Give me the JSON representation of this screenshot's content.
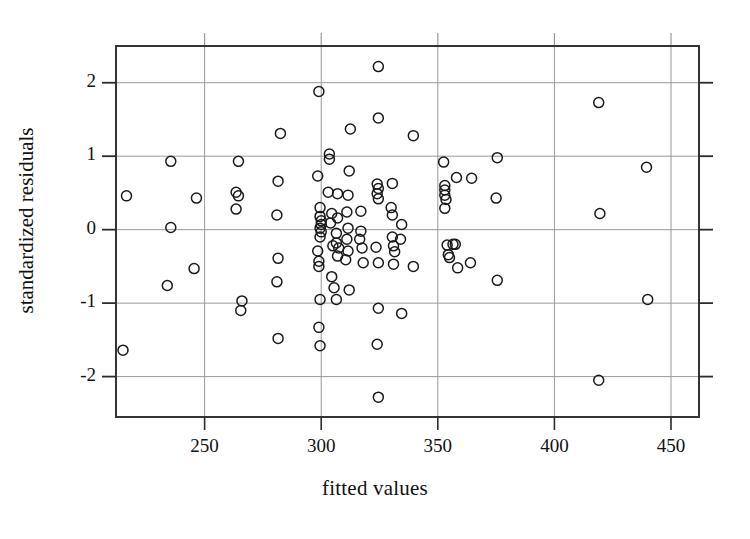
{
  "chart_data": {
    "type": "scatter",
    "title": "",
    "xlabel": "fitted values",
    "ylabel": "standardized residuals",
    "xlim": [
      212,
      462
    ],
    "ylim": [
      -2.55,
      2.5
    ],
    "xticks": [
      250,
      300,
      350,
      400,
      450
    ],
    "yticks": [
      2,
      1,
      0,
      -1,
      -2
    ],
    "xtick_labels": [
      "250",
      "300",
      "350",
      "400",
      "450"
    ],
    "ytick_labels": [
      "2",
      "1",
      "0",
      "-1",
      "-2"
    ],
    "grid": true,
    "grid_color": "#9a9a9a",
    "frame_color": "#2b2b2b",
    "marker": "open-circle",
    "marker_color": "#1a1a1a",
    "marker_radius": 5,
    "legend": null,
    "n_points": 108,
    "points": [
      [
        216.5,
        0.46
      ],
      [
        215.0,
        -1.64
      ],
      [
        235.5,
        0.93
      ],
      [
        235.5,
        0.03
      ],
      [
        234.0,
        -0.76
      ],
      [
        246.5,
        0.43
      ],
      [
        245.5,
        -0.53
      ],
      [
        264.5,
        0.93
      ],
      [
        263.5,
        0.51
      ],
      [
        264.5,
        0.46
      ],
      [
        263.5,
        0.28
      ],
      [
        266.0,
        -0.97
      ],
      [
        265.5,
        -1.1
      ],
      [
        282.5,
        1.31
      ],
      [
        281.5,
        0.66
      ],
      [
        281.0,
        0.2
      ],
      [
        281.5,
        -0.39
      ],
      [
        281.0,
        -0.71
      ],
      [
        281.5,
        -1.48
      ],
      [
        299.0,
        1.88
      ],
      [
        298.5,
        0.73
      ],
      [
        299.5,
        0.3
      ],
      [
        299.5,
        0.18
      ],
      [
        300.0,
        0.12
      ],
      [
        300.0,
        0.07
      ],
      [
        299.5,
        0.02
      ],
      [
        300.0,
        -0.03
      ],
      [
        299.5,
        -0.1
      ],
      [
        298.5,
        -0.29
      ],
      [
        299.0,
        -0.43
      ],
      [
        299.0,
        -0.5
      ],
      [
        299.5,
        -0.95
      ],
      [
        299.0,
        -1.33
      ],
      [
        299.5,
        -1.58
      ],
      [
        303.5,
        1.03
      ],
      [
        303.5,
        0.96
      ],
      [
        303.0,
        0.51
      ],
      [
        304.5,
        0.22
      ],
      [
        304.0,
        0.09
      ],
      [
        305.0,
        -0.22
      ],
      [
        304.5,
        -0.64
      ],
      [
        305.5,
        -0.79
      ],
      [
        307.0,
        0.49
      ],
      [
        307.0,
        0.16
      ],
      [
        306.5,
        -0.05
      ],
      [
        306.5,
        -0.18
      ],
      [
        307.5,
        -0.25
      ],
      [
        307.0,
        -0.36
      ],
      [
        306.5,
        -0.95
      ],
      [
        312.5,
        1.37
      ],
      [
        312.0,
        0.8
      ],
      [
        311.5,
        0.47
      ],
      [
        311.0,
        0.24
      ],
      [
        311.5,
        0.02
      ],
      [
        311.0,
        -0.13
      ],
      [
        311.5,
        -0.29
      ],
      [
        310.5,
        -0.41
      ],
      [
        312.0,
        -0.82
      ],
      [
        317.0,
        0.25
      ],
      [
        317.0,
        -0.02
      ],
      [
        316.5,
        -0.13
      ],
      [
        317.5,
        -0.25
      ],
      [
        318.0,
        -0.45
      ],
      [
        324.5,
        2.22
      ],
      [
        324.5,
        1.52
      ],
      [
        324.0,
        0.62
      ],
      [
        324.5,
        0.56
      ],
      [
        324.0,
        0.49
      ],
      [
        324.5,
        0.42
      ],
      [
        323.5,
        -0.24
      ],
      [
        324.5,
        -0.45
      ],
      [
        324.5,
        -1.07
      ],
      [
        324.0,
        -1.56
      ],
      [
        324.5,
        -2.28
      ],
      [
        330.5,
        0.63
      ],
      [
        330.0,
        0.3
      ],
      [
        330.5,
        0.2
      ],
      [
        330.5,
        -0.1
      ],
      [
        331.0,
        -0.22
      ],
      [
        331.5,
        -0.3
      ],
      [
        331.0,
        -0.47
      ],
      [
        334.5,
        0.07
      ],
      [
        334.0,
        -0.13
      ],
      [
        334.5,
        -1.14
      ],
      [
        339.5,
        1.28
      ],
      [
        339.5,
        -0.5
      ],
      [
        352.5,
        0.92
      ],
      [
        353.0,
        0.6
      ],
      [
        353.0,
        0.54
      ],
      [
        353.0,
        0.47
      ],
      [
        353.5,
        0.41
      ],
      [
        353.0,
        0.29
      ],
      [
        354.0,
        -0.21
      ],
      [
        354.5,
        -0.34
      ],
      [
        355.0,
        -0.38
      ],
      [
        356.5,
        -0.2
      ],
      [
        358.0,
        0.71
      ],
      [
        357.5,
        -0.2
      ],
      [
        358.5,
        -0.52
      ],
      [
        364.5,
        0.7
      ],
      [
        364.0,
        -0.45
      ],
      [
        375.5,
        0.98
      ],
      [
        375.0,
        0.43
      ],
      [
        375.5,
        -0.69
      ],
      [
        419.0,
        1.73
      ],
      [
        419.5,
        0.22
      ],
      [
        419.0,
        -2.05
      ],
      [
        439.5,
        0.85
      ],
      [
        440.0,
        -0.95
      ]
    ]
  },
  "figure": {
    "background_color": "#ffffff",
    "plot_left_px": 116,
    "plot_right_px": 699,
    "plot_top_px": 46,
    "plot_bottom_px": 417
  }
}
